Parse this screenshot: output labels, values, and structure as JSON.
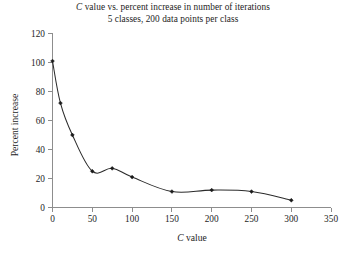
{
  "chart_data": {
    "type": "line",
    "title": "C value vs. percent increase in number of iterations",
    "subtitle": "5 classes, 200 data points per class",
    "title_italic_prefix": "C",
    "title_rest": " value vs. percent increase in number of iterations",
    "xlabel": "C value",
    "xlabel_italic_prefix": "C",
    "xlabel_rest": " value",
    "ylabel": "Percent increase",
    "xlim": [
      0,
      350
    ],
    "ylim": [
      0,
      120
    ],
    "xticks": [
      0,
      50,
      100,
      150,
      200,
      250,
      300,
      350
    ],
    "yticks": [
      0,
      20,
      40,
      60,
      80,
      100,
      120
    ],
    "grid": false,
    "legend": "none",
    "marker": "diamond",
    "line_color": "#2b2b2b",
    "marker_color": "#1a1a1a",
    "axis_color": "#8d8d8d",
    "x": [
      0,
      10,
      25,
      50,
      75,
      100,
      150,
      200,
      250,
      300
    ],
    "y": [
      101,
      72,
      50,
      25,
      27,
      21,
      11,
      12,
      11,
      5
    ],
    "points": [
      {
        "x": 0,
        "y": 101
      },
      {
        "x": 10,
        "y": 72
      },
      {
        "x": 25,
        "y": 50
      },
      {
        "x": 50,
        "y": 25
      },
      {
        "x": 75,
        "y": 27
      },
      {
        "x": 100,
        "y": 21
      },
      {
        "x": 150,
        "y": 11
      },
      {
        "x": 200,
        "y": 12
      },
      {
        "x": 250,
        "y": 11
      },
      {
        "x": 300,
        "y": 5
      }
    ]
  }
}
